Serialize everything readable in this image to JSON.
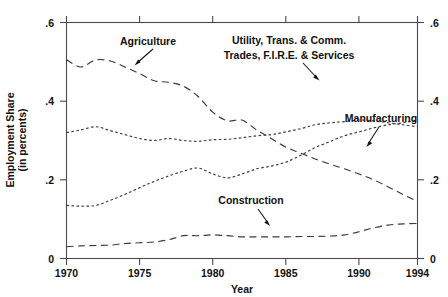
{
  "chart_data": {
    "type": "line",
    "title": "",
    "xlabel": "Year",
    "ylabel": "Employment Share\n(in percents)",
    "ylabel_line1": "Employment Share",
    "ylabel_line2": "(in percents)",
    "xlim": [
      1970,
      1994
    ],
    "ylim": [
      0,
      0.6
    ],
    "xticks": [
      1970,
      1975,
      1980,
      1985,
      1990,
      1994
    ],
    "xticklabels": [
      "1970",
      "1975",
      "1980",
      "1985",
      "1990",
      "1994"
    ],
    "yticks": [
      0,
      0.2,
      0.4,
      0.6
    ],
    "yticklabels": [
      "0",
      ".2",
      ".4",
      ".6"
    ],
    "right_axis": true,
    "right_yticklabels": [
      "0",
      ".2",
      ".4",
      ".6"
    ],
    "grid": false,
    "legend": "inline-annotations",
    "x": [
      1970,
      1971,
      1972,
      1973,
      1974,
      1975,
      1976,
      1977,
      1978,
      1979,
      1980,
      1981,
      1982,
      1983,
      1984,
      1985,
      1986,
      1987,
      1988,
      1989,
      1990,
      1991,
      1992,
      1993,
      1994
    ],
    "series": [
      {
        "name": "Agriculture",
        "linestyle": "long-dash",
        "color": "#3a3a3a",
        "values": [
          0.505,
          0.487,
          0.505,
          0.502,
          0.487,
          0.47,
          0.452,
          0.448,
          0.438,
          0.412,
          0.372,
          0.35,
          0.352,
          0.327,
          0.305,
          0.283,
          0.268,
          0.253,
          0.24,
          0.228,
          0.215,
          0.2,
          0.182,
          0.163,
          0.145
        ]
      },
      {
        "name": "Utility, Trans. & Comm. Trades, F.I.R.E. & Services",
        "label_line1": "Utility, Trans. & Comm.",
        "label_line2": "Trades, F.I.R.E. & Services",
        "linestyle": "dotted",
        "color": "#3a3a3a",
        "values": [
          0.135,
          0.133,
          0.135,
          0.148,
          0.163,
          0.18,
          0.196,
          0.21,
          0.222,
          0.23,
          0.215,
          0.205,
          0.215,
          0.228,
          0.235,
          0.245,
          0.262,
          0.282,
          0.297,
          0.312,
          0.322,
          0.332,
          0.34,
          0.345,
          0.352
        ]
      },
      {
        "name": "Manufacturing",
        "linestyle": "dotted",
        "color": "#3a3a3a",
        "values": [
          0.32,
          0.327,
          0.335,
          0.325,
          0.315,
          0.305,
          0.3,
          0.305,
          0.3,
          0.298,
          0.302,
          0.303,
          0.307,
          0.312,
          0.315,
          0.322,
          0.33,
          0.34,
          0.345,
          0.348,
          0.352,
          0.35,
          0.345,
          0.34,
          0.335
        ]
      },
      {
        "name": "Construction",
        "linestyle": "long-dash",
        "color": "#3a3a3a",
        "values": [
          0.03,
          0.032,
          0.033,
          0.034,
          0.038,
          0.04,
          0.042,
          0.048,
          0.058,
          0.058,
          0.06,
          0.058,
          0.055,
          0.055,
          0.055,
          0.055,
          0.056,
          0.056,
          0.057,
          0.06,
          0.068,
          0.078,
          0.085,
          0.088,
          0.089
        ]
      }
    ],
    "annotations": [
      {
        "name": "agriculture-label",
        "text": "Agriculture"
      },
      {
        "name": "services-label-line1",
        "text": "Utility, Trans. & Comm."
      },
      {
        "name": "services-label-line2",
        "text": "Trades, F.I.R.E. & Services"
      },
      {
        "name": "manufacturing-label",
        "text": "Manufacturing"
      },
      {
        "name": "construction-label",
        "text": "Construction"
      }
    ]
  },
  "axes": {
    "x_title": "Year",
    "y_title_line1": "Employment Share",
    "y_title_line2": "(in percents)",
    "x_tick_1": "1970",
    "x_tick_2": "1975",
    "x_tick_3": "1980",
    "x_tick_4": "1985",
    "x_tick_5": "1990",
    "x_tick_6": "1994",
    "y_tick_0": "0",
    "y_tick_2": ".2",
    "y_tick_4": ".4",
    "y_tick_6": ".6",
    "ry_tick_0": "0",
    "ry_tick_2": ".2",
    "ry_tick_4": ".4",
    "ry_tick_6": ".6"
  },
  "labels": {
    "agriculture": "Agriculture",
    "services_line1": "Utility, Trans. & Comm.",
    "services_line2": "Trades, F.I.R.E. & Services",
    "manufacturing": "Manufacturing",
    "construction": "Construction"
  },
  "colors": {
    "line": "#3a3a3a",
    "frame": "#4a4a4a",
    "text": "#111111",
    "background": "#ffffff"
  }
}
